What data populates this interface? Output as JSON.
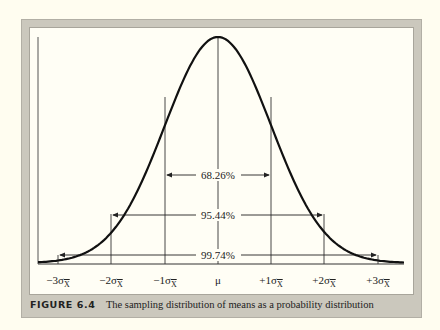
{
  "figure": {
    "label": "FIGURE 6.4",
    "caption": "The sampling distribution of means as a probability distribution"
  },
  "axis": {
    "ticks": [
      {
        "prefix": "−3σ",
        "sub": "X"
      },
      {
        "prefix": "−2σ",
        "sub": "X"
      },
      {
        "prefix": "−1σ",
        "sub": "X"
      },
      {
        "prefix": "μ",
        "sub": ""
      },
      {
        "prefix": "+1σ",
        "sub": "X"
      },
      {
        "prefix": "+2σ",
        "sub": "X"
      },
      {
        "prefix": "+3σ",
        "sub": "X"
      }
    ]
  },
  "intervals": {
    "one_sigma": "68.26%",
    "two_sigma": "95.44%",
    "three_sigma": "99.74%"
  },
  "colors": {
    "frame": "#cbc8bd",
    "background": "#fffef5",
    "curve": "#111111"
  }
}
